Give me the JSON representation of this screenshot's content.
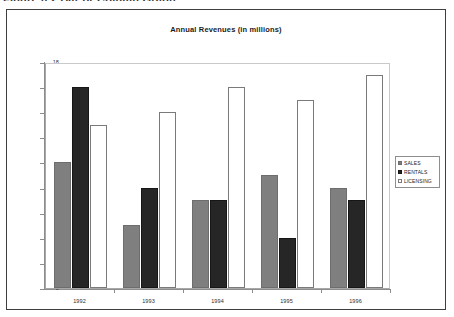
{
  "figure": {
    "caption": "Figure 6.2  Bar or Column Graph"
  },
  "chart_data": {
    "type": "bar",
    "title": "Annual Revenues (in millions)",
    "xlabel": "",
    "ylabel": "",
    "categories": [
      "1992",
      "1993",
      "1994",
      "1995",
      "1996"
    ],
    "series": [
      {
        "name": "SALES",
        "values": [
          10,
          5,
          7,
          9,
          8
        ],
        "color": "#7f7f7f"
      },
      {
        "name": "RENTALS",
        "values": [
          16,
          8,
          7,
          4,
          7
        ],
        "color": "#262626"
      },
      {
        "name": "LICENSING",
        "values": [
          13,
          14,
          16,
          15,
          17
        ],
        "color": "#ffffff"
      }
    ],
    "ylim": [
      0,
      18
    ],
    "yticks": [
      18,
      16,
      14,
      12,
      10,
      8,
      6,
      4,
      2,
      0
    ],
    "grid": false,
    "legend_position": "right"
  },
  "legend": {
    "items": [
      {
        "label": "SALES"
      },
      {
        "label": "RENTALS"
      },
      {
        "label": "LICENSING"
      }
    ]
  }
}
